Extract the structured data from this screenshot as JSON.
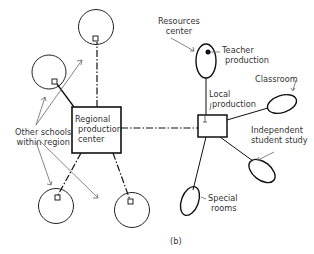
{
  "diagram": {
    "caption": "(b)",
    "nodes": {
      "regional_center": {
        "line1": "Regional",
        "line2": "production",
        "line3": "center"
      },
      "other_schools": {
        "line1": "Other schools",
        "line2": "within region"
      },
      "resources_center": {
        "line1": "Resources",
        "line2": "center"
      },
      "teacher_production": {
        "line1": "Teacher",
        "line2": "production"
      },
      "local_production": {
        "line1": "Local",
        "line2": "production"
      },
      "classroom": {
        "line1": "Classroom"
      },
      "independent_study": {
        "line1": "Independent",
        "line2": "student study"
      },
      "special_rooms": {
        "line1": "Special",
        "line2": "rooms"
      }
    },
    "colors": {
      "stroke": "#111111",
      "pointer": "#666666",
      "text": "#333333",
      "background": "#ffffff"
    }
  }
}
